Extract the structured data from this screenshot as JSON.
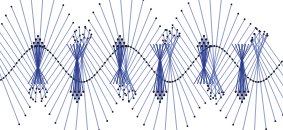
{
  "diagram": {
    "title": "Bobbin lace pricking pattern",
    "type": "lace-pattern",
    "colors": {
      "background": "#ffffff",
      "thread": "#4a5fa8",
      "thread_dark": "#2f3f8f",
      "pin": "#1a1a2a"
    },
    "layout": {
      "width": 283,
      "height": 130,
      "center_y": 64,
      "wave_amplitude": 18,
      "wave_period": 88,
      "wave_phase_x": 38,
      "ray_length": 56,
      "ray_count": 26
    },
    "fans": [
      {
        "x": 38,
        "orientation": "up"
      },
      {
        "x": 77,
        "orientation": "down"
      },
      {
        "x": 120,
        "orientation": "up"
      },
      {
        "x": 160,
        "orientation": "down"
      },
      {
        "x": 204,
        "orientation": "up"
      },
      {
        "x": 242,
        "orientation": "down"
      }
    ]
  }
}
